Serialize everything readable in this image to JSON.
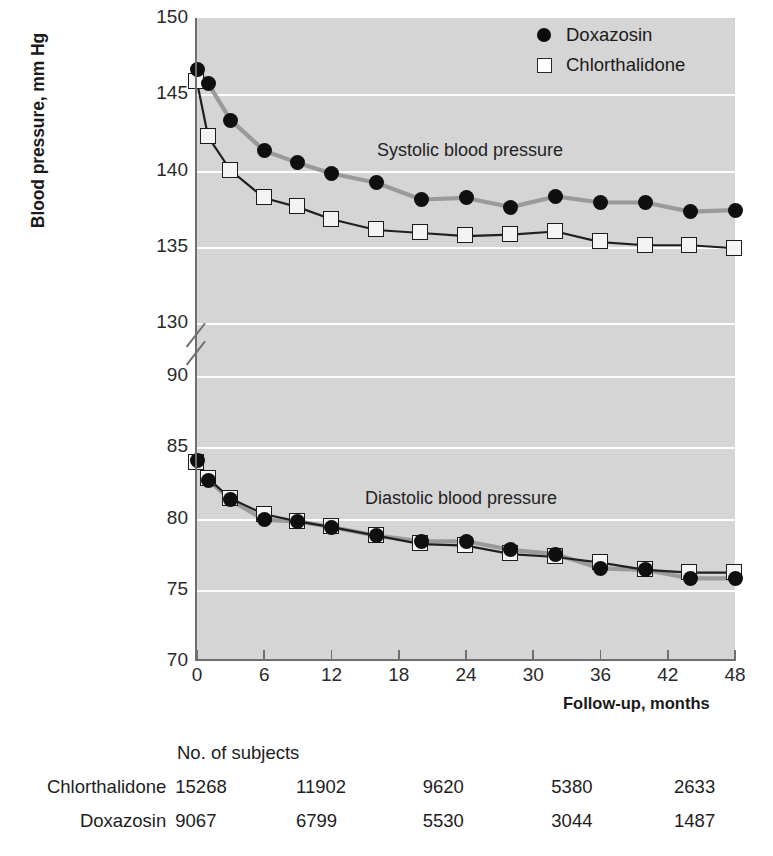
{
  "axes": {
    "ylabel": "Blood pressure, mm Hg",
    "xlabel": "Follow-up, months",
    "yticks_upper": [
      "150",
      "145",
      "140",
      "135",
      "130"
    ],
    "yticks_lower": [
      "90",
      "85",
      "80",
      "75",
      "70"
    ],
    "xticks": [
      "0",
      "6",
      "12",
      "18",
      "24",
      "30",
      "36",
      "42",
      "48"
    ]
  },
  "legend": {
    "items": [
      {
        "label": "Doxazosin",
        "marker": "filled-circle",
        "color": "#0d0d0d"
      },
      {
        "label": "Chlorthalidone",
        "marker": "open-square",
        "color": "#2a2a2a"
      }
    ]
  },
  "annotations": {
    "systolic": "Systolic blood pressure",
    "diastolic": "Diastolic blood pressure"
  },
  "table": {
    "header": "No. of subjects",
    "rows": [
      {
        "name": "Chlorthalidone",
        "values": [
          "15268",
          "11902",
          "9620",
          "5380",
          "2633"
        ]
      },
      {
        "name": "Doxazosin",
        "values": [
          "9067",
          "6799",
          "5530",
          "3044",
          "1487"
        ]
      }
    ]
  },
  "chart_data": {
    "type": "line",
    "title": "",
    "xlabel": "Follow-up, months",
    "ylabel": "Blood pressure, mm Hg",
    "xlim": [
      0,
      48
    ],
    "ylim_upper": [
      130,
      150
    ],
    "ylim_lower": [
      70,
      90
    ],
    "axis_break": true,
    "grid": true,
    "legend_position": "top-right",
    "x": [
      0,
      1,
      3,
      6,
      9,
      12,
      16,
      20,
      24,
      28,
      32,
      36,
      40,
      44,
      48
    ],
    "series": [
      {
        "name": "Doxazosin",
        "measure": "Systolic blood pressure",
        "marker": "filled-circle",
        "values": [
          146.6,
          145.7,
          143.3,
          141.3,
          140.5,
          139.8,
          139.2,
          138.1,
          138.2,
          137.6,
          138.3,
          137.9,
          137.9,
          137.3,
          137.4
        ]
      },
      {
        "name": "Chlorthalidone",
        "measure": "Systolic blood pressure",
        "marker": "open-square",
        "values": [
          145.8,
          142.2,
          140.0,
          138.2,
          137.6,
          136.8,
          136.1,
          135.9,
          135.7,
          135.8,
          136.0,
          135.3,
          135.1,
          135.1,
          134.9
        ]
      },
      {
        "name": "Doxazosin",
        "measure": "Diastolic blood pressure",
        "marker": "filled-circle",
        "values": [
          84.1,
          82.7,
          81.3,
          79.9,
          79.8,
          79.4,
          78.8,
          78.4,
          78.4,
          77.8,
          77.5,
          76.5,
          76.4,
          75.8,
          75.8
        ]
      },
      {
        "name": "Chlorthalidone",
        "measure": "Diastolic blood pressure",
        "marker": "open-square",
        "values": [
          83.9,
          82.8,
          81.4,
          80.3,
          79.8,
          79.4,
          78.8,
          78.2,
          78.1,
          77.5,
          77.3,
          76.9,
          76.4,
          76.2,
          76.2
        ]
      }
    ]
  }
}
